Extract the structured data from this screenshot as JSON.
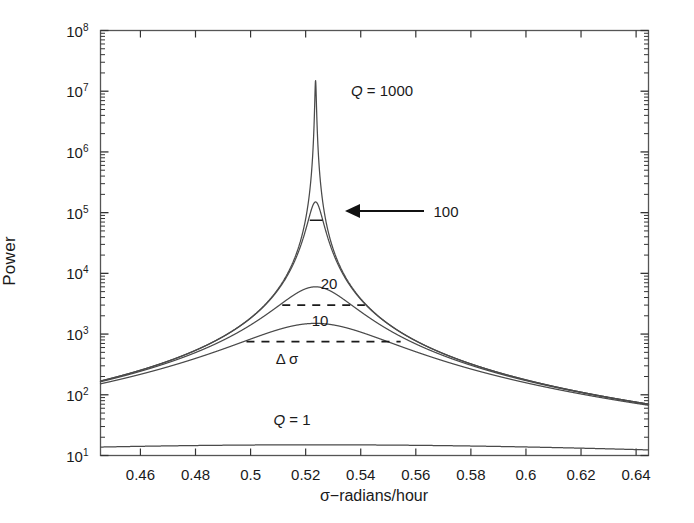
{
  "figure": {
    "name": "resonance-power-spectrum",
    "background": "#ffffff"
  },
  "axes": {
    "xlabel": "σ−radians/hour",
    "ylabel": "Power",
    "x_ticks": [
      "0.46",
      "0.48",
      "0.5",
      "0.52",
      "0.54",
      "0.56",
      "0.58",
      "0.6",
      "0.62",
      "0.64"
    ],
    "y_ticks": [
      {
        "mantissa": "10",
        "exponent": "1"
      },
      {
        "mantissa": "10",
        "exponent": "2"
      },
      {
        "mantissa": "10",
        "exponent": "3"
      },
      {
        "mantissa": "10",
        "exponent": "4"
      },
      {
        "mantissa": "10",
        "exponent": "5"
      },
      {
        "mantissa": "10",
        "exponent": "6"
      },
      {
        "mantissa": "10",
        "exponent": "7"
      },
      {
        "mantissa": "10",
        "exponent": "8"
      }
    ],
    "frame_color": "#555555",
    "tick_color": "#333333"
  },
  "annotations": {
    "q1000": "Q = 1000",
    "q100": "100",
    "q20": "20",
    "q10": "10",
    "delta_sigma": "Δ σ",
    "q1": "Q = 1"
  },
  "chart_data": {
    "type": "line",
    "title": "",
    "xlabel": "σ−radians/hour",
    "ylabel": "Power",
    "xlim": [
      0.4455,
      0.6445
    ],
    "ylim": [
      10,
      100000000
    ],
    "yscale": "log",
    "xscale": "linear",
    "grid": false,
    "legend": "inline-annotations",
    "resonance_center": 0.5236,
    "line_color": "#4a4a4a",
    "series": [
      {
        "name": "Q = 1000",
        "Q": 1000,
        "peak_sigma": 0.5236,
        "peak_power": 15000000,
        "half_width_delta_sigma": 0.00052,
        "color": "#4a4a4a"
      },
      {
        "name": "Q = 100",
        "Q": 100,
        "peak_sigma": 0.5236,
        "peak_power": 150000,
        "half_width_delta_sigma": 0.0052,
        "color": "#4a4a4a"
      },
      {
        "name": "20",
        "Q": 20,
        "peak_sigma": 0.5236,
        "peak_power": 6000,
        "half_width_delta_sigma": 0.026,
        "color": "#4a4a4a"
      },
      {
        "name": "10",
        "Q": 10,
        "peak_sigma": 0.5236,
        "peak_power": 1500,
        "half_width_delta_sigma": 0.052,
        "color": "#4a4a4a"
      },
      {
        "name": "Q = 1",
        "Q": 1,
        "peak_sigma": 0.5236,
        "peak_power": 15,
        "half_width_delta_sigma": 0.52,
        "color": "#4a4a4a"
      }
    ],
    "halfpower_markers": [
      {
        "series": "Q = 100",
        "y": 75000,
        "x_start": 0.5215,
        "x_end": 0.5262
      },
      {
        "series": "20",
        "y": 3000,
        "x_start": 0.5115,
        "x_end": 0.5415
      },
      {
        "series": "10",
        "y": 750,
        "x_start": 0.4985,
        "x_end": 0.5545
      }
    ]
  }
}
